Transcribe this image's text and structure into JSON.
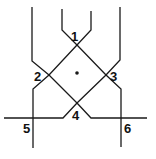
{
  "diagram": {
    "type": "line-crossing-network",
    "colors": {
      "line": "#1a1a1a",
      "background": "#ffffff"
    },
    "center_marker": {
      "x": 77,
      "y": 73,
      "label": ""
    },
    "nodes": [
      {
        "id": "1",
        "label": "1",
        "x": 77,
        "y": 45
      },
      {
        "id": "2",
        "label": "2",
        "x": 49,
        "y": 75
      },
      {
        "id": "3",
        "label": "3",
        "x": 106,
        "y": 75
      },
      {
        "id": "4",
        "label": "4",
        "x": 77,
        "y": 103
      },
      {
        "id": "5",
        "label": "5",
        "x": 33,
        "y": 118
      },
      {
        "id": "6",
        "label": "6",
        "x": 121,
        "y": 118
      }
    ]
  }
}
